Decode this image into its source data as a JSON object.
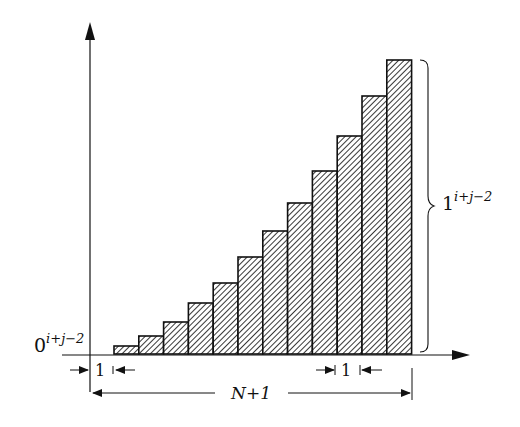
{
  "diagram": {
    "type": "staircase-histogram",
    "bar_count": 12,
    "baseline_y": 354,
    "bar_x_start": 114,
    "bar_width": 24.8,
    "bar_tops": [
      346,
      336,
      322,
      303,
      283,
      257,
      231,
      203,
      171,
      136,
      96,
      60
    ],
    "colors": {
      "line": "#111111",
      "hatch": "#222222",
      "background": "#ffffff"
    }
  },
  "labels": {
    "left_base": "0",
    "left_exp": "i+j−2",
    "right_base": "1",
    "right_exp": "i+j−2",
    "unit_left": "1",
    "unit_right": "1",
    "span": "N+1"
  }
}
